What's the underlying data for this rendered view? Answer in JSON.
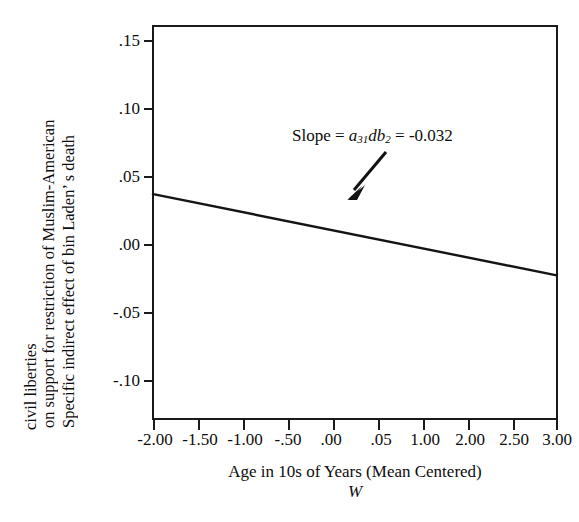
{
  "figure": {
    "top_caption": "",
    "line_color": "#141414",
    "frame_color": "#1a1a1a",
    "text_color": "#0d0d0d"
  },
  "chart_data": {
    "type": "line",
    "title": "",
    "xlabel": "Age in 10s of Years (Mean Centered)",
    "xlabel_moderator": "W",
    "ylabel_lines": [
      "Specific indirect effect of bin Laden’ s death",
      "on support for restriction of Muslim-American",
      "civil liberties"
    ],
    "xlim": [
      -2.0,
      3.0
    ],
    "ylim": [
      -0.125,
      0.165
    ],
    "xticks": [
      -2.0,
      -1.5,
      -1.0,
      -0.5,
      0.0,
      0.5,
      1.0,
      2.0,
      2.5,
      3.0
    ],
    "xticklabels": [
      "-2.00",
      "-1.50",
      "-1.00",
      "-.50",
      ".00",
      ".05",
      "1.00",
      "2.00",
      "2.50",
      "3.00"
    ],
    "yticks": [
      0.15,
      0.1,
      0.05,
      0.0,
      -0.05,
      -0.1
    ],
    "yticklabels": [
      ".15",
      ".10",
      ".05",
      ".00",
      "-.05",
      "-.10"
    ],
    "grid": false,
    "legend": null,
    "series": [
      {
        "name": "Specific indirect effect",
        "x": [
          -2.0,
          3.0
        ],
        "values": [
          0.041,
          -0.019
        ]
      }
    ],
    "annotations": [
      {
        "name": "slope-annotation",
        "prefix": "Slope = ",
        "coef_a": "a",
        "coef_a_sub": "31",
        "coef_db": "db",
        "coef_db_sub": "2",
        "equals": " = ",
        "value": "-0.032",
        "arrow": "down-left"
      }
    ]
  }
}
